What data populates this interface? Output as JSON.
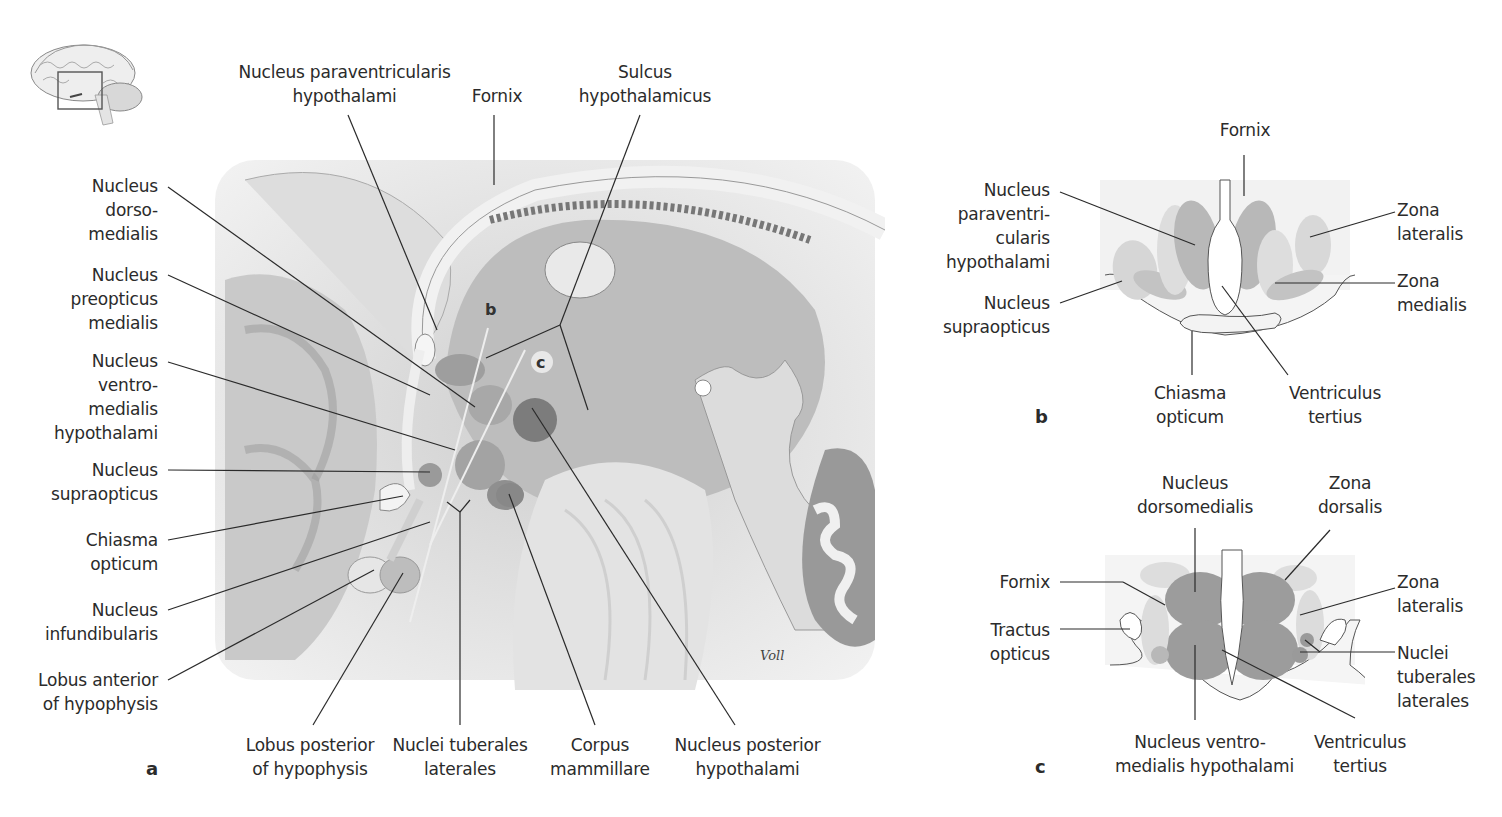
{
  "figure": {
    "thumbnail": {
      "description": "whole brain sagittal thumbnail with highlighted hypothalamus region"
    },
    "signature": "Voll",
    "panel_a": {
      "letter": "a",
      "top_labels": {
        "paraventricular": [
          "Nucleus paraventricularis",
          "hypothalami"
        ],
        "fornix": "Fornix",
        "sulcus": [
          "Sulcus",
          "hypothalamicus"
        ]
      },
      "left_labels": {
        "dorsomedialis": [
          "Nucleus",
          "dorso-",
          "medialis"
        ],
        "preopticus": [
          "Nucleus",
          "preopticus",
          "medialis"
        ],
        "ventromedialis": [
          "Nucleus",
          "ventro-",
          "medialis",
          "hypothalami"
        ],
        "supraopticus": [
          "Nucleus",
          "supraopticus"
        ],
        "chiasma": [
          "Chiasma",
          "opticum"
        ],
        "infundibularis": [
          "Nucleus",
          "infundibularis"
        ],
        "lobus_anterior": [
          "Lobus anterior",
          "of hypophysis"
        ]
      },
      "bottom_labels": {
        "lobus_posterior": [
          "Lobus posterior",
          "of hypophysis"
        ],
        "tuberales": [
          "Nuclei tuberales",
          "laterales"
        ],
        "mammillare": [
          "Corpus",
          "mammillare"
        ],
        "posterior": [
          "Nucleus posterior",
          "hypothalami"
        ]
      },
      "section_markers": {
        "b": "b",
        "c": "c"
      }
    },
    "panel_b": {
      "letter": "b",
      "labels": {
        "fornix": "Fornix",
        "paraventricularis": [
          "Nucleus",
          "paraventri-",
          "cularis",
          "hypothalami"
        ],
        "supraopticus": [
          "Nucleus",
          "supraopticus"
        ],
        "zona_lateralis": [
          "Zona",
          "lateralis"
        ],
        "zona_medialis": [
          "Zona",
          "medialis"
        ],
        "chiasma": [
          "Chiasma",
          "opticum"
        ],
        "ventriculus": [
          "Ventriculus",
          "tertius"
        ]
      }
    },
    "panel_c": {
      "letter": "c",
      "labels": {
        "dorsomedialis": [
          "Nucleus",
          "dorsomedialis"
        ],
        "zona_dorsalis": [
          "Zona",
          "dorsalis"
        ],
        "fornix": "Fornix",
        "tractus": [
          "Tractus",
          "opticus"
        ],
        "zona_lateralis": [
          "Zona",
          "lateralis"
        ],
        "tuberales": [
          "Nuclei",
          "tuberales",
          "laterales"
        ],
        "ventromedialis": [
          "Nucleus ventro-",
          "medialis hypothalami"
        ],
        "ventriculus": [
          "Ventriculus",
          "tertius"
        ]
      }
    }
  }
}
